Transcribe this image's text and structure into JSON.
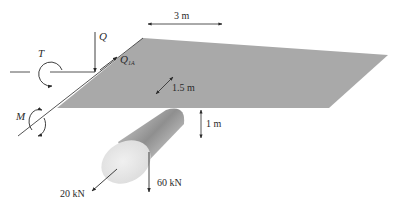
{
  "figure": {
    "type": "engineering free-body diagram"
  },
  "dimensions": {
    "width": "3 m",
    "depth": "1.5 m",
    "drop": "1 m"
  },
  "loads": {
    "axial": "20 kN",
    "vertical": "60 kN"
  },
  "reactions": {
    "shear_vertical": "Q",
    "shear_in_plane": "Q",
    "shear_in_plane_sub": "1A",
    "torque": "T",
    "moment": "M"
  },
  "colors": {
    "plate": "#a9a9a9",
    "cylinder_dark": "#9a9a9a",
    "cylinder_light": "#e6e6e6",
    "line": "#2a2a2a"
  }
}
